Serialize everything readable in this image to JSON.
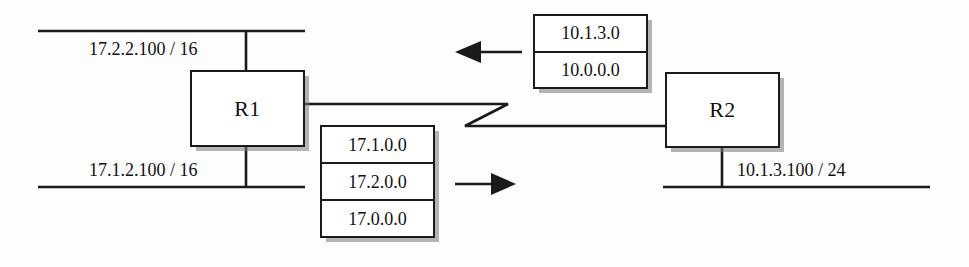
{
  "diagram": {
    "background_color": "#fdfdfd",
    "line_color": "#1a1a1a"
  },
  "routers": [
    {
      "id": "r1",
      "label": "R1"
    },
    {
      "id": "r2",
      "label": "R2"
    }
  ],
  "interface_labels": [
    {
      "id": "r1-lan-top",
      "text": "17.2.2.100 / 16"
    },
    {
      "id": "r1-lan-bottom",
      "text": "17.1.2.100 / 16"
    },
    {
      "id": "r2-lan",
      "text": "10.1.3.100 / 24"
    }
  ],
  "routing_tables": [
    {
      "id": "r2-table",
      "owner": "R2",
      "direction": "left",
      "entries": [
        "10.1.3.0",
        "10.0.0.0"
      ]
    },
    {
      "id": "r1-table",
      "owner": "R1",
      "direction": "right",
      "entries": [
        "17.1.0.0",
        "17.2.0.0",
        "17.0.0.0"
      ]
    }
  ],
  "arrows": [
    {
      "id": "arrow-left",
      "direction": "left",
      "points_to": "R1"
    },
    {
      "id": "arrow-right",
      "direction": "right",
      "points_to": "R2"
    }
  ]
}
